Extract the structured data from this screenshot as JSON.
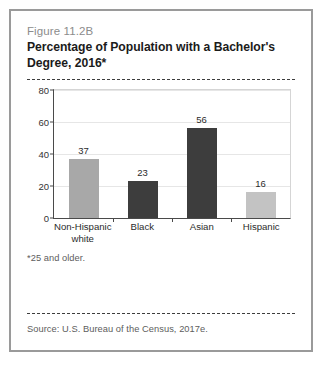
{
  "figure": {
    "number": "Figure 11.2B",
    "title": "Percentage of Population with a Bachelor's Degree, 2016*",
    "footnote": "*25 and older.",
    "source": "Source: U.S. Bureau of the Census, 2017e."
  },
  "colors": {
    "bar_medium_gray": "#a8a8a8",
    "bar_dark": "#3d3d3d",
    "bar_light_gray": "#c3c3c3",
    "axis": "#4a4a4a",
    "grid": "#e6e6e6",
    "card_border": "#9a9a9a",
    "fig_number_text": "#8c8c8c"
  },
  "chart_data": {
    "type": "bar",
    "title": "Percentage of Population with a Bachelor's Degree, 2016*",
    "xlabel": "",
    "ylabel": "",
    "ylim": [
      0,
      80
    ],
    "yticks": [
      0,
      20,
      40,
      60,
      80
    ],
    "ytick_labels": [
      "0",
      "20",
      "40",
      "60",
      "80"
    ],
    "grid": true,
    "legend": "none",
    "categories": [
      "Non-Hispanic\nwhite",
      "Black",
      "Asian",
      "Hispanic"
    ],
    "values": [
      37,
      23,
      56,
      16
    ],
    "value_labels": [
      "37",
      "23",
      "56",
      "16"
    ],
    "bar_colors": [
      "#a8a8a8",
      "#3d3d3d",
      "#3d3d3d",
      "#c3c3c3"
    ],
    "annotations": [
      "*25 and older.",
      "Source: U.S. Bureau of the Census, 2017e."
    ]
  }
}
